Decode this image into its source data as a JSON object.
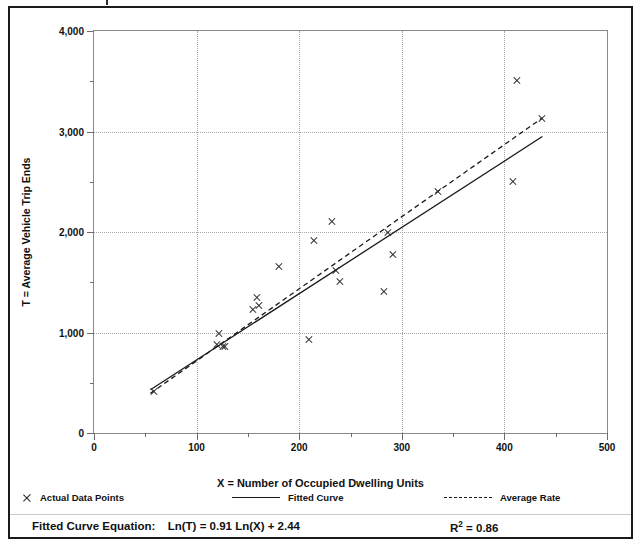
{
  "figure": {
    "background": "#ffffff",
    "frame_color": "#1a1a1a"
  },
  "axis_titles": {
    "y": "T = Average Vehicle Trip Ends",
    "x": "X = Number of Occupied Dwelling Units"
  },
  "legend": {
    "items": [
      {
        "marker": "x-marker-icon",
        "label": "Actual Data Points"
      },
      {
        "marker": "solid-line-icon",
        "label": "Fitted Curve"
      },
      {
        "marker": "dashed-line-icon",
        "label": "Average Rate"
      }
    ]
  },
  "footer": {
    "equation_label": "Fitted Curve Equation:",
    "equation": "Ln(T) = 0.91 Ln(X) + 2.44",
    "r2_prefix": "R",
    "r2_exponent": "2",
    "r2_value": " = 0.86"
  },
  "chart_data": {
    "type": "scatter",
    "title": "",
    "xlabel": "X = Number of Occupied Dwelling Units",
    "ylabel": "T = Average Vehicle Trip Ends",
    "xlim": [
      0,
      500
    ],
    "ylim": [
      0,
      4000
    ],
    "xticks": [
      0,
      100,
      200,
      300,
      400,
      500
    ],
    "xtick_labels": [
      "0",
      "100",
      "200",
      "300",
      "400",
      "500"
    ],
    "xticks_minor": [
      50,
      150,
      250,
      350,
      450
    ],
    "yticks": [
      0,
      1000,
      2000,
      3000,
      4000
    ],
    "ytick_labels": [
      "0",
      "1,000",
      "2,000",
      "3,000",
      "4,000"
    ],
    "yticks_minor": [
      500,
      1500,
      2500,
      3500
    ],
    "grid": "dotted major gridlines, both axes",
    "legend_position": "below plot",
    "series": [
      {
        "name": "Actual Data Points",
        "type": "scatter",
        "marker": "x",
        "color": "#262626",
        "points": [
          {
            "x": 58,
            "y": 410
          },
          {
            "x": 120,
            "y": 880
          },
          {
            "x": 122,
            "y": 990
          },
          {
            "x": 126,
            "y": 860
          },
          {
            "x": 128,
            "y": 865
          },
          {
            "x": 155,
            "y": 1230
          },
          {
            "x": 159,
            "y": 1350
          },
          {
            "x": 161,
            "y": 1265
          },
          {
            "x": 180,
            "y": 1660
          },
          {
            "x": 210,
            "y": 930
          },
          {
            "x": 214,
            "y": 1920
          },
          {
            "x": 232,
            "y": 2100
          },
          {
            "x": 236,
            "y": 1615
          },
          {
            "x": 240,
            "y": 1510
          },
          {
            "x": 283,
            "y": 1410
          },
          {
            "x": 287,
            "y": 2000
          },
          {
            "x": 291,
            "y": 1780
          },
          {
            "x": 335,
            "y": 2400
          },
          {
            "x": 408,
            "y": 2500
          },
          {
            "x": 412,
            "y": 3510
          },
          {
            "x": 437,
            "y": 3130
          }
        ]
      },
      {
        "name": "Fitted Curve",
        "type": "line",
        "style": "solid",
        "color": "#1a1a1a",
        "equation": "Ln(T) = 0.91 Ln(X) + 2.44",
        "r_squared": 0.86,
        "points": [
          {
            "x": 55,
            "y": 430
          },
          {
            "x": 437,
            "y": 2950
          }
        ]
      },
      {
        "name": "Average Rate",
        "type": "line",
        "style": "dashed",
        "color": "#1a1a1a",
        "points": [
          {
            "x": 55,
            "y": 395
          },
          {
            "x": 437,
            "y": 3135
          }
        ]
      }
    ]
  }
}
